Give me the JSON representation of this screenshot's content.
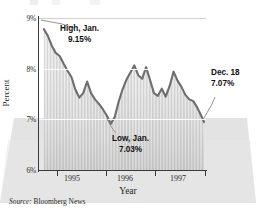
{
  "chart_data": {
    "type": "area",
    "title": "",
    "subtitle": "",
    "xlabel": "Year",
    "ylabel": "Percent",
    "ylim": [
      6,
      9.4
    ],
    "ytick_values": [
      6,
      7,
      8,
      9
    ],
    "ytick_labels": [
      "6%",
      "7%",
      "8%",
      "9%"
    ],
    "xlim": [
      1994.6,
      1998.0
    ],
    "xtick_values": [
      1995,
      1996,
      1997
    ],
    "xtick_labels": [
      "1995",
      "1996",
      "1997"
    ],
    "grid": true,
    "legend": "none",
    "series": [
      {
        "name": "Interest rate",
        "color": "#6e6e6e",
        "fill": "vertical-hatch",
        "x": [
          1994.7,
          1994.78,
          1994.86,
          1994.94,
          1995.02,
          1995.1,
          1995.18,
          1995.26,
          1995.34,
          1995.42,
          1995.5,
          1995.58,
          1995.66,
          1995.74,
          1995.82,
          1995.9,
          1995.98,
          1996.06,
          1996.14,
          1996.22,
          1996.3,
          1996.38,
          1996.46,
          1996.54,
          1996.62,
          1996.7,
          1996.78,
          1996.86,
          1996.94,
          1997.02,
          1997.1,
          1997.18,
          1997.26,
          1997.34,
          1997.42,
          1997.5,
          1997.58,
          1997.66,
          1997.74,
          1997.82,
          1997.9,
          1997.96
        ],
        "y": [
          9.15,
          9.0,
          8.78,
          8.62,
          8.55,
          8.38,
          8.22,
          8.08,
          7.8,
          7.62,
          7.72,
          7.98,
          7.72,
          7.58,
          7.48,
          7.36,
          7.22,
          7.03,
          7.18,
          7.52,
          7.8,
          8.02,
          8.18,
          8.34,
          8.12,
          8.04,
          8.3,
          8.02,
          7.72,
          7.66,
          7.82,
          7.64,
          7.88,
          8.2,
          8.0,
          7.86,
          7.68,
          7.58,
          7.54,
          7.4,
          7.22,
          7.07
        ]
      }
    ],
    "annotations": [
      {
        "id": "high",
        "line1": "High, Jan.",
        "line2": "9.15%",
        "target_x": 1994.7,
        "target_y": 9.15
      },
      {
        "id": "low",
        "line1": "Low, Jan.",
        "line2": "7.03%",
        "target_x": 1996.06,
        "target_y": 7.03
      },
      {
        "id": "last",
        "line1": "Dec. 18",
        "line2": "7.07%",
        "target_x": 1997.96,
        "target_y": 7.07
      }
    ]
  },
  "footer": {
    "source_label": "Source:",
    "source_name": "Bloomberg News"
  }
}
